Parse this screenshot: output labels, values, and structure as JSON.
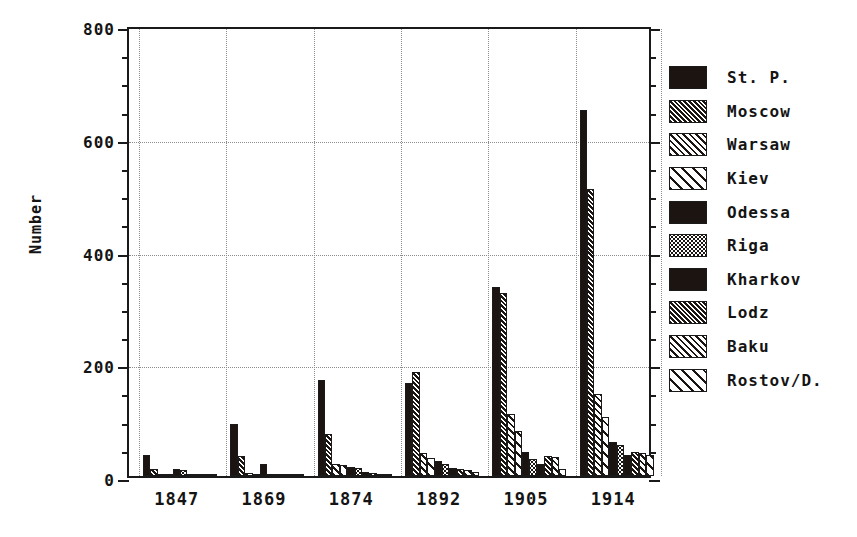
{
  "chart_data": {
    "type": "bar",
    "title": "",
    "xlabel": "",
    "ylabel": "Number",
    "ylim": [
      0,
      800
    ],
    "yticks": [
      0,
      200,
      400,
      600,
      800
    ],
    "ytick_labels": [
      "0",
      "200",
      "400",
      "600",
      "800"
    ],
    "yminor_step": 50,
    "grid": "dotted, horizontal at major y ticks and vertical at group boundaries",
    "legend_position": "right",
    "categories": [
      "1847",
      "1869",
      "1874",
      "1892",
      "1905",
      "1914"
    ],
    "series": [
      {
        "name": "St. P.",
        "pattern": "solid",
        "values": [
          38,
          92,
          170,
          165,
          335,
          650
        ]
      },
      {
        "name": "Moscow",
        "pattern": "hatch1",
        "values": [
          12,
          35,
          75,
          185,
          325,
          510
        ]
      },
      {
        "name": "Warsaw",
        "pattern": "hatch2",
        "values": [
          4,
          5,
          22,
          40,
          110,
          145
        ]
      },
      {
        "name": "Kiev",
        "pattern": "hatch3",
        "values": [
          3,
          3,
          20,
          32,
          80,
          105
        ]
      },
      {
        "name": "Odessa",
        "pattern": "solid",
        "values": [
          13,
          22,
          16,
          26,
          42,
          60
        ]
      },
      {
        "name": "Riga",
        "pattern": "dots",
        "values": [
          10,
          4,
          14,
          22,
          30,
          55
        ]
      },
      {
        "name": "Kharkov",
        "pattern": "solid",
        "values": [
          3,
          2,
          8,
          14,
          22,
          38
        ]
      },
      {
        "name": "Lodz",
        "pattern": "hatch1",
        "values": [
          2,
          2,
          6,
          12,
          36,
          42
        ]
      },
      {
        "name": "Baku",
        "pattern": "hatch2",
        "values": [
          1,
          1,
          4,
          10,
          33,
          40
        ]
      },
      {
        "name": "Rostov/D.",
        "pattern": "hatch3",
        "values": [
          1,
          1,
          3,
          8,
          12,
          38
        ]
      }
    ]
  },
  "legend": {
    "items": [
      {
        "label": "St. P."
      },
      {
        "label": "Moscow"
      },
      {
        "label": "Warsaw"
      },
      {
        "label": "Kiev"
      },
      {
        "label": "Odessa"
      },
      {
        "label": "Riga"
      },
      {
        "label": "Kharkov"
      },
      {
        "label": "Lodz"
      },
      {
        "label": "Baku"
      },
      {
        "label": "Rostov/D."
      }
    ]
  },
  "colors": {
    "ink": "#1c1410",
    "frame": "#1a1a1a",
    "grid": "#8c8c8c",
    "background": "#ffffff"
  }
}
